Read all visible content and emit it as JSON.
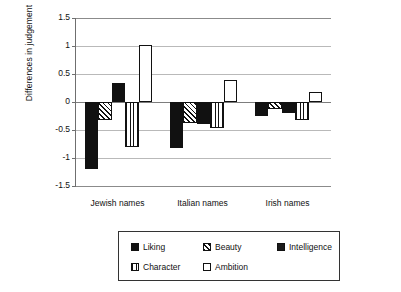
{
  "chart_data": {
    "type": "bar",
    "title": "",
    "xlabel": "",
    "ylabel": "Differences in judgement",
    "categories": [
      "Jewish names",
      "Italian names",
      "Irish names"
    ],
    "ylim": [
      -1.5,
      1.5
    ],
    "yticks": [
      "1.5",
      "1",
      "0.5",
      "0",
      "-0.5",
      "-1",
      "-1.5"
    ],
    "ytick_values": [
      1.5,
      1,
      0.5,
      0,
      -0.5,
      -1,
      -1.5
    ],
    "grid": true,
    "legend_position": "bottom",
    "series": [
      {
        "name": "Liking",
        "pattern": "solid",
        "values": [
          -1.2,
          -0.82,
          -0.25
        ]
      },
      {
        "name": "Beauty",
        "pattern": "diagonal",
        "values": [
          -0.32,
          -0.38,
          -0.13
        ]
      },
      {
        "name": "Intelligence",
        "pattern": "solid",
        "values": [
          0.34,
          -0.4,
          -0.2
        ]
      },
      {
        "name": "Character",
        "pattern": "vertical",
        "values": [
          -0.8,
          -0.47,
          -0.32
        ]
      },
      {
        "name": "Ambition",
        "pattern": "open",
        "values": [
          1.02,
          0.39,
          0.18
        ]
      }
    ]
  },
  "axis": {
    "y_title": "Differences in judgement",
    "tick_0": "1.5",
    "tick_1": "1",
    "tick_2": "0.5",
    "tick_3": "0",
    "tick_4": "-0.5",
    "tick_5": "-1",
    "tick_6": "-1.5"
  },
  "categories": {
    "c0": "Jewish names",
    "c1": "Italian names",
    "c2": "Irish names"
  },
  "legend": {
    "items": [
      {
        "label": "Liking"
      },
      {
        "label": "Beauty"
      },
      {
        "label": "Intelligence"
      },
      {
        "label": "Character"
      },
      {
        "label": "Ambition"
      }
    ],
    "l0": "Liking",
    "l1": "Beauty",
    "l2": "Intelligence",
    "l3": "Character",
    "l4": "Ambition"
  },
  "colors": {
    "ink": "#111111",
    "grid": "#b9b9b9",
    "axis": "#6f6f6f",
    "background": "#ffffff"
  }
}
